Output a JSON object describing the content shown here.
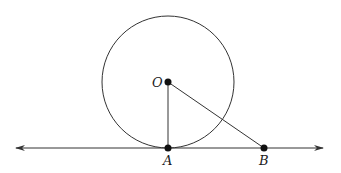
{
  "diagram": {
    "type": "geometry-tangent-line",
    "circle": {
      "center_label": "O",
      "cx": 168,
      "cy": 82,
      "r": 66
    },
    "tangent_line": {
      "y": 148,
      "x_start": 16,
      "x_end": 323,
      "arrows": "both"
    },
    "points": [
      {
        "label": "O",
        "x": 168,
        "y": 82
      },
      {
        "label": "A",
        "x": 168,
        "y": 148
      },
      {
        "label": "B",
        "x": 264,
        "y": 148
      }
    ],
    "segments": [
      {
        "from": "O",
        "to": "A"
      },
      {
        "from": "O",
        "to": "B"
      }
    ],
    "colors": {
      "stroke": "#333333",
      "point": "#111111"
    }
  }
}
